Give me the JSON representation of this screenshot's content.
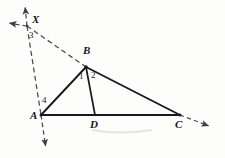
{
  "figure": {
    "canvas": {
      "width": 225,
      "height": 158
    },
    "stroke_color": "#1a1a1e",
    "dash_color": "#4a4a50",
    "background_color": "#fdfdfc",
    "points": [
      {
        "id": "A",
        "label": "A",
        "x": 41,
        "y": 115,
        "label_x": 30,
        "label_y": 112
      },
      {
        "id": "B",
        "label": "B",
        "x": 86,
        "y": 67,
        "label_x": 84,
        "label_y": 47
      },
      {
        "id": "C",
        "label": "C",
        "x": 180,
        "y": 115,
        "label_x": 176,
        "label_y": 119
      },
      {
        "id": "D",
        "label": "D",
        "x": 95,
        "y": 115,
        "label_x": 91,
        "label_y": 119
      },
      {
        "id": "X",
        "label": "X",
        "x": 27,
        "y": 26,
        "label_x": 32,
        "label_y": 15
      }
    ],
    "angle_marks": [
      {
        "id": "angle-1",
        "label": "1",
        "vertex": "B",
        "x": 80,
        "y": 76
      },
      {
        "id": "angle-2",
        "label": "2",
        "vertex": "B",
        "x": 92,
        "y": 75
      },
      {
        "id": "angle-3",
        "label": "3",
        "vertex": "X",
        "x": 29,
        "y": 33
      },
      {
        "id": "angle-4",
        "label": "4",
        "vertex": "A",
        "x": 43,
        "y": 99
      }
    ],
    "solid_segments": [
      {
        "id": "segment-AB",
        "from": "A",
        "to": "B"
      },
      {
        "id": "segment-BC",
        "from": "B",
        "to": "C"
      },
      {
        "id": "segment-AC",
        "from": "A",
        "to": "C"
      },
      {
        "id": "segment-BD",
        "from": "B",
        "to": "D"
      }
    ],
    "dashed_lines": [
      {
        "id": "line-XBC-extended",
        "description": "dashed line through X, B and C extended beyond C",
        "from_x": 6,
        "from_y": 22,
        "to_x": 212,
        "to_y": 128,
        "arrow_start": true,
        "arrow_end": true
      },
      {
        "id": "line-XA-extended",
        "description": "dashed line through X and A extended past both ends",
        "from_x": 24,
        "from_y": 4,
        "to_x": 46,
        "to_y": 150,
        "arrow_start": true,
        "arrow_end": true
      }
    ]
  }
}
